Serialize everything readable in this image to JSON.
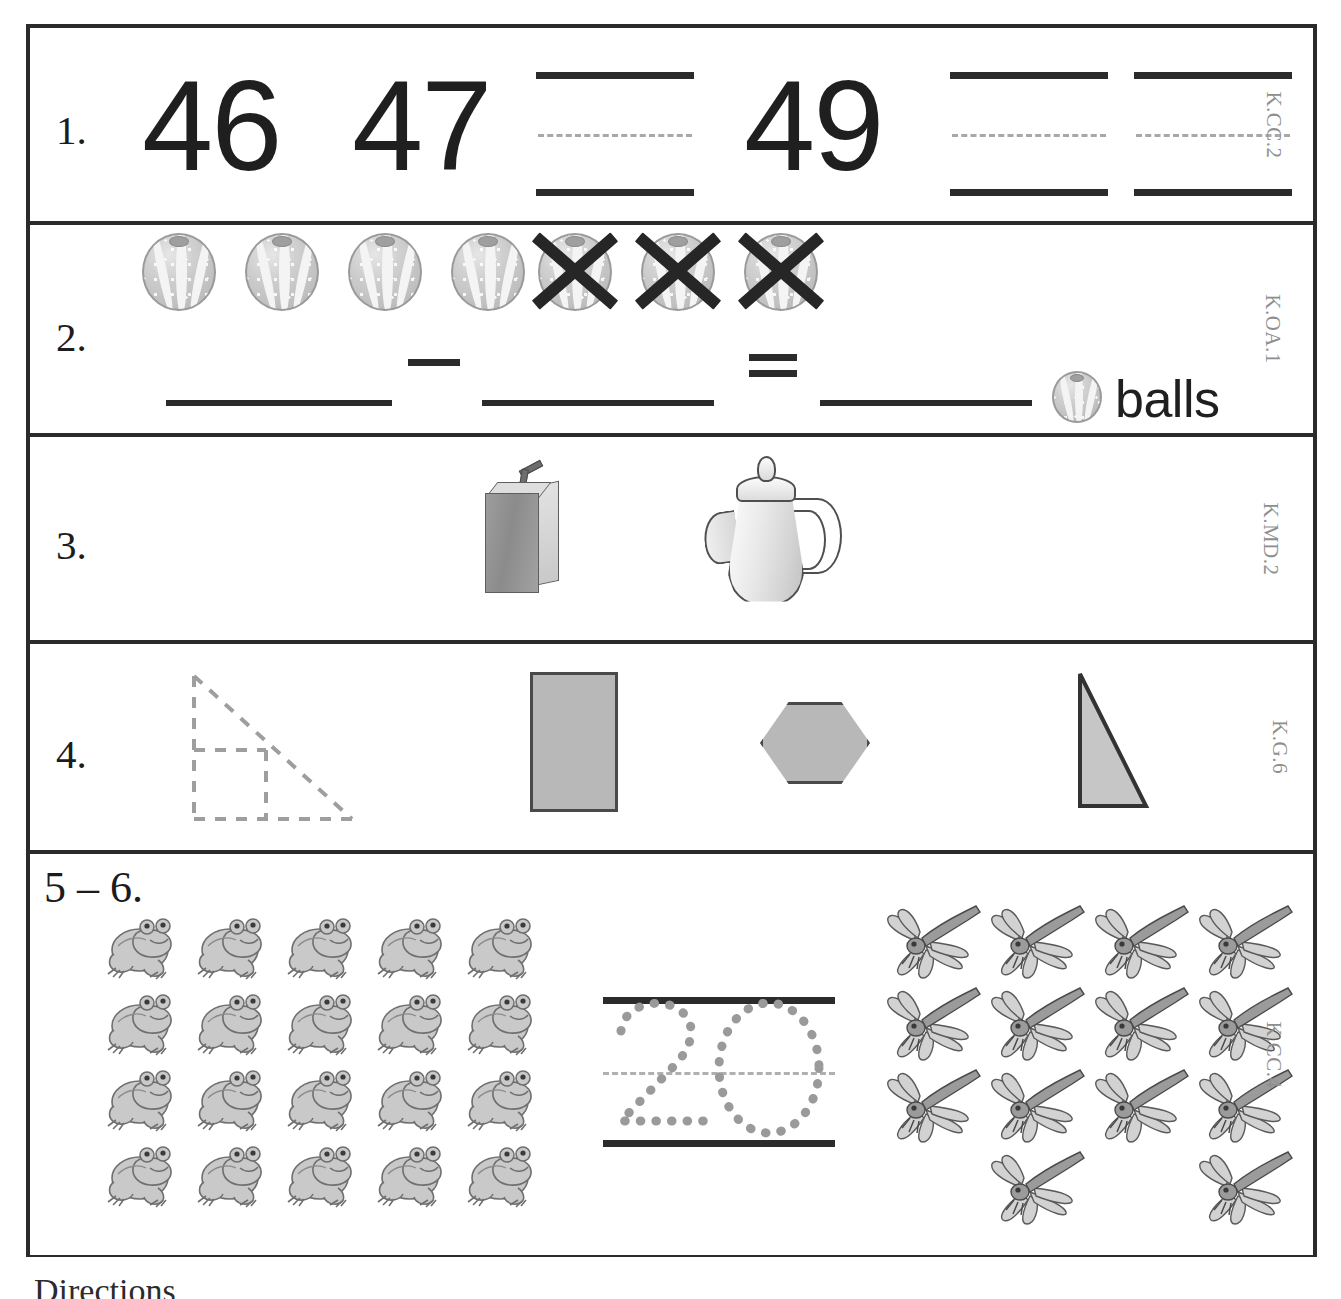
{
  "worksheet": {
    "bottom_text": "Directions",
    "rows": [
      {
        "number": "1.",
        "standard": "K.CC.2",
        "task": "count-sequence-fill-in",
        "numbers_shown": [
          "46",
          "47",
          "49"
        ],
        "blanks": 3,
        "sequence": [
          "46",
          "47",
          "",
          "49",
          "",
          ""
        ]
      },
      {
        "number": "2.",
        "standard": "K.OA.1",
        "task": "subtraction-with-pictures",
        "unit_label": "balls",
        "total_balls": 7,
        "crossed_out": 3,
        "remaining": 4,
        "equation": [
          "",
          "-",
          "",
          "=",
          ""
        ],
        "minus_symbol": "−",
        "equals_symbol": "="
      },
      {
        "number": "3.",
        "standard": "K.MD.2",
        "task": "compare-capacity",
        "objects": [
          "juice-box",
          "teapot"
        ]
      },
      {
        "number": "4.",
        "standard": "K.G.6",
        "task": "compose-shapes",
        "target_shape": "dashed-right-triangle-with-inner-lines",
        "shape_choices": [
          "rectangle",
          "hexagon",
          "triangle"
        ]
      },
      {
        "number": "5 – 6.",
        "standard": "K.CC.4",
        "task": "count-objects",
        "left_group": {
          "object": "frog",
          "count": 20,
          "columns": 5,
          "rows": 4
        },
        "center_trace": {
          "digits": "20"
        },
        "right_group": {
          "object": "dragonfly",
          "count": 14,
          "columns": 4,
          "rows": 4,
          "last_row_count": 2
        }
      }
    ]
  },
  "colors": {
    "ink": "#2b2b2b",
    "standard_code": "#8e8e8e",
    "shape_fill": "#b8b8b8",
    "shape_stroke": "#4a4a4a",
    "trace_dot": "#9a9a9a",
    "guide_dash": "#a8a8a8"
  }
}
